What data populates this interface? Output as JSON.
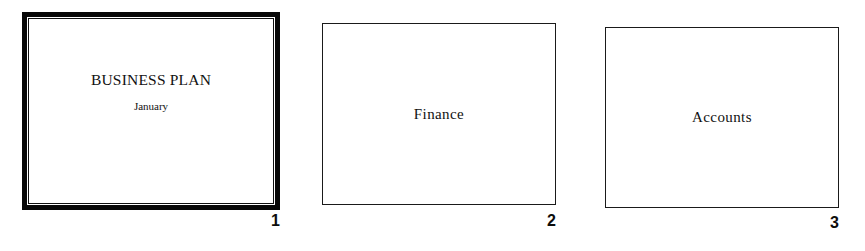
{
  "view": {
    "name": "slide-sorter",
    "background_color": "#ffffff",
    "ink_color": "#111111",
    "selection_color": "#070707"
  },
  "slides": [
    {
      "number": "1",
      "title": "BUSINESS PLAN",
      "subtitle": "January",
      "selected": true
    },
    {
      "number": "2",
      "title": "Finance",
      "subtitle": "",
      "selected": false
    },
    {
      "number": "3",
      "title": "Accounts",
      "subtitle": "",
      "selected": false
    }
  ]
}
